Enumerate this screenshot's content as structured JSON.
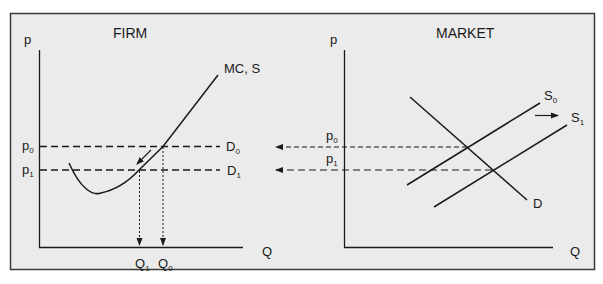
{
  "colors": {
    "background": "#ebebeb",
    "frame": "#3a3a3a",
    "ink": "#1a1a1a"
  },
  "firm": {
    "title": "FIRM",
    "y_axis_label": "p",
    "x_axis_label": "Q",
    "curve_label": "MC, S",
    "price_labels": {
      "p0_main": "p",
      "p0_sub": "0",
      "p1_main": "p",
      "p1_sub": "1"
    },
    "demand_labels": {
      "d0_main": "D",
      "d0_sub": "0",
      "d1_main": "D",
      "d1_sub": "1"
    },
    "quantity_labels": {
      "q1_main": "Q",
      "q1_sub": "1",
      "q0_main": "Q",
      "q0_sub": "0"
    }
  },
  "market": {
    "title": "MARKET",
    "y_axis_label": "p",
    "x_axis_label": "Q",
    "price_labels": {
      "p0_main": "p",
      "p0_sub": "0",
      "p1_main": "p",
      "p1_sub": "1"
    },
    "supply_labels": {
      "s0_main": "S",
      "s0_sub": "0",
      "s1_main": "S",
      "s1_sub": "1"
    },
    "demand_label": "D"
  }
}
